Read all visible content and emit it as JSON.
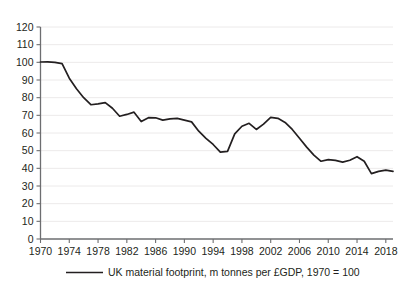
{
  "chart_data": {
    "type": "line",
    "title": "",
    "subtitle": "",
    "xlabel": "",
    "ylabel": "",
    "grid": true,
    "legend_position": "bottom",
    "xlim": [
      1970,
      2019
    ],
    "ylim": [
      0,
      120
    ],
    "ytick_step": 10,
    "xtick_step": 4,
    "yticks": [
      0,
      10,
      20,
      30,
      40,
      50,
      60,
      70,
      80,
      90,
      100,
      110,
      120
    ],
    "ytick_labels": [
      "0",
      "10",
      "20",
      "30",
      "40",
      "50",
      "60",
      "70",
      "80",
      "90",
      "100",
      "110",
      "120"
    ],
    "xticks": [
      1970,
      1974,
      1978,
      1982,
      1986,
      1990,
      1994,
      1998,
      2002,
      2006,
      2010,
      2014,
      2018
    ],
    "xtick_labels": [
      "1970",
      "1974",
      "1978",
      "1982",
      "1986",
      "1990",
      "1994",
      "1998",
      "2002",
      "2006",
      "2010",
      "2014",
      "2018"
    ],
    "legend": [
      "UK material footprint, m tonnes per £GDP, 1970 = 100"
    ],
    "series": [
      {
        "name": "UK material footprint, m tonnes per £GDP, 1970 = 100",
        "color": "#231f20",
        "x": [
          1970,
          1971,
          1972,
          1973,
          1974,
          1975,
          1976,
          1977,
          1978,
          1979,
          1980,
          1981,
          1982,
          1983,
          1984,
          1985,
          1986,
          1987,
          1988,
          1989,
          1990,
          1991,
          1992,
          1993,
          1994,
          1995,
          1996,
          1997,
          1998,
          1999,
          2000,
          2001,
          2002,
          2003,
          2004,
          2005,
          2006,
          2007,
          2008,
          2009,
          2010,
          2011,
          2012,
          2013,
          2014,
          2015,
          2016,
          2017,
          2018,
          2019
        ],
        "values": [
          100.2,
          100.3,
          100.0,
          99.3,
          91.0,
          85.0,
          80.0,
          76.0,
          76.5,
          77.2,
          74.0,
          69.5,
          70.5,
          71.8,
          66.5,
          68.7,
          68.6,
          67.3,
          68.0,
          68.3,
          67.3,
          66.3,
          61.0,
          57.0,
          53.5,
          49.2,
          49.6,
          59.5,
          63.8,
          65.5,
          62.0,
          65.0,
          68.8,
          68.3,
          66.0,
          62.0,
          57.0,
          52.0,
          47.5,
          44.0,
          44.9,
          44.5,
          43.5,
          44.6,
          46.6,
          44.0,
          37.0,
          38.3,
          39.0,
          38.3
        ]
      }
    ]
  },
  "legend": {
    "label": "UK material footprint, m tonnes per £GDP, 1970 = 100"
  }
}
